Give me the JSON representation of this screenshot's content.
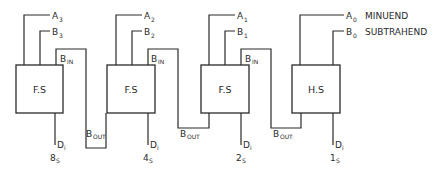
{
  "diagram": {
    "blocks": [
      {
        "id": "fs3",
        "label": "F.S",
        "a": "A",
        "a_sub": "3",
        "b": "B",
        "b_sub": "3",
        "bin": "B",
        "bin_sub": "IN",
        "d": "D",
        "d_sub": "i",
        "out": "8",
        "out_sub": "S",
        "bout": "B",
        "bout_sub": "OUT"
      },
      {
        "id": "fs2",
        "label": "F.S",
        "a": "A",
        "a_sub": "2",
        "b": "B",
        "b_sub": "2",
        "bin": "B",
        "bin_sub": "IN",
        "d": "D",
        "d_sub": "i",
        "out": "4",
        "out_sub": "S",
        "bout": "B",
        "bout_sub": "OUT"
      },
      {
        "id": "fs1",
        "label": "F.S",
        "a": "A",
        "a_sub": "1",
        "b": "B",
        "b_sub": "1",
        "bin": "B",
        "bin_sub": "IN",
        "d": "D",
        "d_sub": "i",
        "out": "2",
        "out_sub": "S",
        "bout": "B",
        "bout_sub": "OUT"
      },
      {
        "id": "hs0",
        "label": "H.S",
        "a": "A",
        "a_sub": "0",
        "b": "B",
        "b_sub": "0",
        "d": "D",
        "d_sub": "i",
        "out": "1",
        "out_sub": "S"
      }
    ],
    "annotations": {
      "minuend": "MINUEND",
      "subtrahend": "SUBTRAHEND"
    }
  }
}
